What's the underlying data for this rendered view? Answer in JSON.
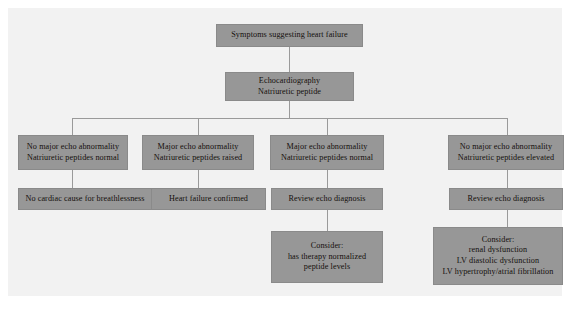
{
  "diagram": {
    "box_fill_color": "#979797",
    "panel_background_color": "#f2f2f2",
    "connector_color": "#9a9a9a",
    "text_color": "#15100d",
    "nodes": {
      "root": {
        "lines": [
          "Symptoms suggesting heart failure"
        ]
      },
      "investigation": {
        "lines": [
          "Echocardiography",
          "Natriuretic peptide"
        ]
      },
      "branch1": {
        "lines": [
          "No major echo abnormality",
          "Natriuretic peptides normal"
        ]
      },
      "branch2": {
        "lines": [
          "Major echo abnormality",
          "Natriuretic peptides raised"
        ]
      },
      "branch3": {
        "lines": [
          "Major echo abnormality",
          "Natriuretic peptides normal"
        ]
      },
      "branch4": {
        "lines": [
          "No major echo abnormality",
          "Natriuretic peptides elevated"
        ]
      },
      "outcome1": {
        "lines": [
          "No cardiac cause for breathlessness"
        ]
      },
      "outcome2": {
        "lines": [
          "Heart failure confirmed"
        ]
      },
      "outcome3": {
        "lines": [
          "Review echo diagnosis"
        ]
      },
      "outcome4": {
        "lines": [
          "Review echo diagnosis"
        ]
      },
      "consider3": {
        "lines": [
          "Consider:",
          "has therapy normalized",
          "peptide levels"
        ]
      },
      "consider4": {
        "lines": [
          "Consider:",
          "renal dysfunction",
          "LV diastolic dysfunction",
          "LV hypertrophy/atrial fibrillation"
        ]
      }
    }
  }
}
